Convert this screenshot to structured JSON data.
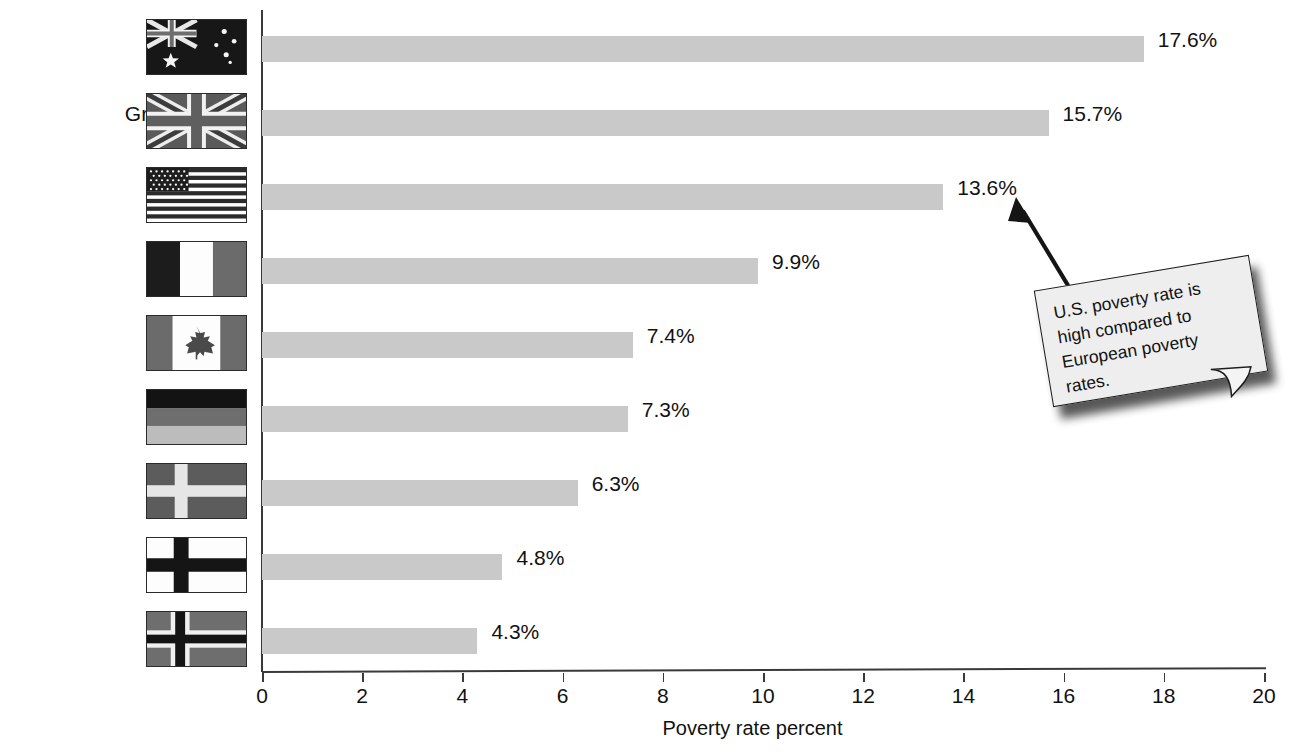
{
  "chart_data": {
    "type": "bar",
    "orientation": "horizontal",
    "title": "",
    "xlabel": "Poverty rate percent",
    "ylabel": "",
    "xlim": [
      0,
      20
    ],
    "xticks": [
      0,
      2,
      4,
      6,
      8,
      10,
      12,
      14,
      16,
      18,
      20
    ],
    "grid": false,
    "legend": null,
    "categories": [
      "Australia",
      "Great Britain",
      "USA",
      "France",
      "Canada",
      "Germany",
      "Sweden",
      "Finland",
      "Norway"
    ],
    "values": [
      17.6,
      15.7,
      13.6,
      9.9,
      7.4,
      7.3,
      6.3,
      4.8,
      4.3
    ],
    "value_labels": [
      "17.6%",
      "15.7%",
      "13.6%",
      "9.9%",
      "7.4%",
      "7.3%",
      "6.3%",
      "4.8%",
      "4.3%"
    ],
    "bar_color": "#c9c9c9",
    "annotations": [
      {
        "text": "U.S. poverty rate is high compared to European poverty rates.",
        "points_to": "USA",
        "style": "sticky-note-with-arrow"
      }
    ]
  },
  "rows": [
    {
      "label": "Australia",
      "value": 17.6,
      "value_label": "17.6%",
      "flag": "australia-flag"
    },
    {
      "label": "Great Britain",
      "value": 15.7,
      "value_label": "15.7%",
      "flag": "great-britain-flag"
    },
    {
      "label": "USA",
      "value": 13.6,
      "value_label": "13.6%",
      "flag": "usa-flag"
    },
    {
      "label": "France",
      "value": 9.9,
      "value_label": "9.9%",
      "flag": "france-flag"
    },
    {
      "label": "Canada",
      "value": 7.4,
      "value_label": "7.4%",
      "flag": "canada-flag"
    },
    {
      "label": "Germany",
      "value": 7.3,
      "value_label": "7.3%",
      "flag": "germany-flag"
    },
    {
      "label": "Sweden",
      "value": 6.3,
      "value_label": "6.3%",
      "flag": "sweden-flag"
    },
    {
      "label": "Finland",
      "value": 4.8,
      "value_label": "4.8%",
      "flag": "finland-flag"
    },
    {
      "label": "Norway",
      "value": 4.3,
      "value_label": "4.3%",
      "flag": "norway-flag"
    }
  ],
  "axis": {
    "ticks": [
      "0",
      "2",
      "4",
      "6",
      "8",
      "10",
      "12",
      "14",
      "16",
      "18",
      "20"
    ],
    "title": "Poverty rate percent"
  },
  "callout": {
    "line1": "U.S. poverty rate is",
    "line2": "high compared to",
    "line3": "European poverty",
    "line4": "rates.",
    "full_text": "U.S. poverty rate is high compared to European poverty rates."
  },
  "colors": {
    "bar": "#c9c9c9",
    "axis": "#3a3a3a",
    "text": "#111111",
    "note_fill": "#eeeeee",
    "note_border": "#1d1d1d"
  }
}
